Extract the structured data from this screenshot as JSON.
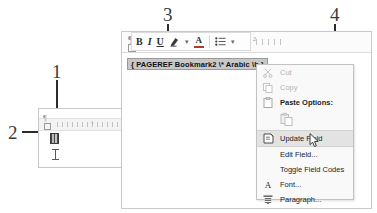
{
  "figure": {
    "callouts": [
      {
        "id": "1",
        "label": "1",
        "points_to": "insertion-point-in-small-document"
      },
      {
        "id": "2",
        "label": "2",
        "points_to": "selected-field-in-small-document"
      },
      {
        "id": "3",
        "label": "3",
        "points_to": "field-code-text"
      },
      {
        "id": "4",
        "label": "4",
        "points_to": "update-field-menu-item"
      }
    ]
  },
  "small_document": {
    "ruler": {
      "number": "1",
      "paragraph_mark": "¶"
    },
    "field_chip_label": "selected-field",
    "cursor_label": "I-beam"
  },
  "main_document": {
    "ruler": {
      "numbers": [
        "1",
        "2"
      ],
      "paragraph_mark": "¶"
    },
    "field_code": "{ PAGEREF  Bookmark2 \\* Arabic \\h }"
  },
  "mini_toolbar": {
    "buttons": [
      {
        "name": "bold",
        "label": "B"
      },
      {
        "name": "italic",
        "label": "I"
      },
      {
        "name": "underline",
        "label": "U"
      },
      {
        "name": "text-highlight-color",
        "label": "✎"
      },
      {
        "name": "dropdown-arrow",
        "label": "▾"
      },
      {
        "name": "font-color",
        "label": "A"
      },
      {
        "name": "bullet-list",
        "label": "≣"
      },
      {
        "name": "list-dropdown-arrow",
        "label": "▾"
      }
    ]
  },
  "context_menu": {
    "items": [
      {
        "label": "Cut",
        "icon": "scissors-icon",
        "state": "disabled",
        "accel": "t"
      },
      {
        "label": "Copy",
        "icon": "copy-icon",
        "state": "disabled",
        "accel": "C"
      },
      {
        "label": "Paste Options:",
        "icon": "clipboard-icon",
        "state": "header"
      },
      {
        "label": "",
        "icon": "paste-keep-formatting-icon",
        "state": "paste-option"
      },
      {
        "label": "Update Field",
        "icon": "update-field-icon",
        "state": "highlighted"
      },
      {
        "label": "Edit Field...",
        "icon": "",
        "state": "normal"
      },
      {
        "label": "Toggle Field Codes",
        "icon": "",
        "state": "normal"
      },
      {
        "label": "Font...",
        "icon": "font-A-icon",
        "state": "normal"
      },
      {
        "label": "Paragraph...",
        "icon": "paragraph-icon",
        "state": "normal"
      }
    ]
  },
  "colors": {
    "menu_bg": "#f9f9f9",
    "highlight": "#e3e3e3",
    "field_selection": "#c8c8c8",
    "disabled_text": "#b4b4b4",
    "font_color_accent": "#b03a2e",
    "callout_line": "#2b2b2b"
  }
}
